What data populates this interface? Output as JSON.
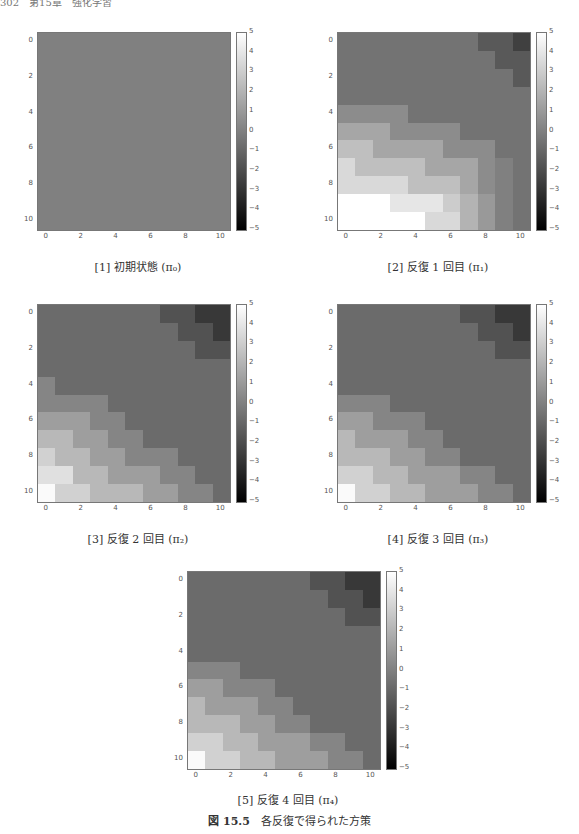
{
  "header": {
    "text": "302　第15章　強化学習"
  },
  "figure": {
    "label": "図 15.5",
    "caption": "各反復で得られた方策"
  },
  "panels": [
    {
      "caption": "[1] 初期状態 (π₀)"
    },
    {
      "caption": "[2] 反復 1 回目 (π₁)"
    },
    {
      "caption": "[3] 反復 2 回目 (π₂)"
    },
    {
      "caption": "[4] 反復 3 回目 (π₃)"
    },
    {
      "caption": "[5] 反復 4 回目 (π₄)"
    }
  ],
  "axis": {
    "yticks": [
      "0",
      "2",
      "4",
      "6",
      "8",
      "10"
    ],
    "xticks": [
      "0",
      "2",
      "4",
      "6",
      "8",
      "10"
    ],
    "cbticks": [
      "5",
      "4",
      "3",
      "2",
      "1",
      "0",
      "−1",
      "−2",
      "−3",
      "−4",
      "−5"
    ]
  },
  "chart_data": [
    {
      "type": "heatmap",
      "title": "[1] 初期状態 (π0)",
      "x": [
        0,
        1,
        2,
        3,
        4,
        5,
        6,
        7,
        8,
        9,
        10
      ],
      "y": [
        0,
        1,
        2,
        3,
        4,
        5,
        6,
        7,
        8,
        9,
        10
      ],
      "colormap": "gray",
      "vmin": -5,
      "vmax": 5,
      "xticks": [
        0,
        2,
        4,
        6,
        8,
        10
      ],
      "yticks": [
        0,
        2,
        4,
        6,
        8,
        10
      ],
      "colorbar_ticks": [
        -5,
        -4,
        -3,
        -2,
        -1,
        0,
        1,
        2,
        3,
        4,
        5
      ],
      "values": [
        [
          0,
          0,
          0,
          0,
          0,
          0,
          0,
          0,
          0,
          0,
          0
        ],
        [
          0,
          0,
          0,
          0,
          0,
          0,
          0,
          0,
          0,
          0,
          0
        ],
        [
          0,
          0,
          0,
          0,
          0,
          0,
          0,
          0,
          0,
          0,
          0
        ],
        [
          0,
          0,
          0,
          0,
          0,
          0,
          0,
          0,
          0,
          0,
          0
        ],
        [
          0,
          0,
          0,
          0,
          0,
          0,
          0,
          0,
          0,
          0,
          0
        ],
        [
          0,
          0,
          0,
          0,
          0,
          0,
          0,
          0,
          0,
          0,
          0
        ],
        [
          0,
          0,
          0,
          0,
          0,
          0,
          0,
          0,
          0,
          0,
          0
        ],
        [
          0,
          0,
          0,
          0,
          0,
          0,
          0,
          0,
          0,
          0,
          0
        ],
        [
          0,
          0,
          0,
          0,
          0,
          0,
          0,
          0,
          0,
          0,
          0
        ],
        [
          0,
          0,
          0,
          0,
          0,
          0,
          0,
          0,
          0,
          0,
          0
        ],
        [
          0,
          0,
          0,
          0,
          0,
          0,
          0,
          0,
          0,
          0,
          0
        ]
      ]
    },
    {
      "type": "heatmap",
      "title": "[2] 反復 1 回目 (π1)",
      "x": [
        0,
        1,
        2,
        3,
        4,
        5,
        6,
        7,
        8,
        9,
        10
      ],
      "y": [
        0,
        1,
        2,
        3,
        4,
        5,
        6,
        7,
        8,
        9,
        10
      ],
      "colormap": "gray",
      "vmin": -5,
      "vmax": 5,
      "xticks": [
        0,
        2,
        4,
        6,
        8,
        10
      ],
      "yticks": [
        0,
        2,
        4,
        6,
        8,
        10
      ],
      "colorbar_ticks": [
        -5,
        -4,
        -3,
        -2,
        -1,
        0,
        1,
        2,
        3,
        4,
        5
      ],
      "values": [
        [
          -0.5,
          -0.5,
          -0.5,
          -0.5,
          -0.5,
          -0.5,
          -0.5,
          -0.5,
          -1.5,
          -1.5,
          -2.5
        ],
        [
          -0.5,
          -0.5,
          -0.5,
          -0.5,
          -0.5,
          -0.5,
          -0.5,
          -0.5,
          -0.5,
          -1.5,
          -1.5
        ],
        [
          -0.5,
          -0.5,
          -0.5,
          -0.5,
          -0.5,
          -0.5,
          -0.5,
          -0.5,
          -0.5,
          -0.5,
          -1.5
        ],
        [
          -0.5,
          -0.5,
          -0.5,
          -0.5,
          -0.5,
          -0.5,
          -0.5,
          -0.5,
          -0.5,
          -0.5,
          -0.5
        ],
        [
          0.5,
          0.5,
          0.5,
          0.5,
          -0.5,
          -0.5,
          -0.5,
          -0.5,
          -0.5,
          -0.5,
          -0.5
        ],
        [
          1.5,
          1.5,
          1.5,
          0.5,
          0.5,
          0.5,
          0.5,
          -0.5,
          -0.5,
          -0.5,
          -0.5
        ],
        [
          2.5,
          2.5,
          1.5,
          1.5,
          1.5,
          1.5,
          0.5,
          0.5,
          0.5,
          -0.5,
          -0.5
        ],
        [
          3.5,
          2.5,
          2.5,
          2.5,
          2.5,
          1.5,
          1.5,
          1.5,
          0.5,
          0,
          -0.5
        ],
        [
          3.5,
          3.5,
          3.5,
          3.5,
          2.5,
          2.5,
          2.5,
          1.5,
          0.5,
          0,
          -0.5
        ],
        [
          5,
          5,
          5,
          4,
          4,
          4,
          3,
          2,
          1,
          0,
          -0.5
        ],
        [
          5,
          5,
          5,
          5,
          5,
          3.5,
          3.5,
          2,
          1,
          0,
          -0.5
        ]
      ]
    },
    {
      "type": "heatmap",
      "title": "[3] 反復 2 回目 (π2)",
      "x": [
        0,
        1,
        2,
        3,
        4,
        5,
        6,
        7,
        8,
        9,
        10
      ],
      "y": [
        0,
        1,
        2,
        3,
        4,
        5,
        6,
        7,
        8,
        9,
        10
      ],
      "colormap": "gray",
      "vmin": -5,
      "vmax": 5,
      "xticks": [
        0,
        2,
        4,
        6,
        8,
        10
      ],
      "yticks": [
        0,
        2,
        4,
        6,
        8,
        10
      ],
      "colorbar_ticks": [
        -5,
        -4,
        -3,
        -2,
        -1,
        0,
        1,
        2,
        3,
        4,
        5
      ],
      "values": [
        [
          -0.8,
          -0.8,
          -0.8,
          -0.8,
          -0.8,
          -0.8,
          -0.8,
          -1.8,
          -1.8,
          -2.8,
          -2.8
        ],
        [
          -0.8,
          -0.8,
          -0.8,
          -0.8,
          -0.8,
          -0.8,
          -0.8,
          -0.8,
          -1.8,
          -1.8,
          -2.8
        ],
        [
          -0.8,
          -0.8,
          -0.8,
          -0.8,
          -0.8,
          -0.8,
          -0.8,
          -0.8,
          -0.8,
          -1.8,
          -1.8
        ],
        [
          -0.8,
          -0.8,
          -0.8,
          -0.8,
          -0.8,
          -0.8,
          -0.8,
          -0.8,
          -0.8,
          -0.8,
          -0.8
        ],
        [
          0.2,
          -0.8,
          -0.8,
          -0.8,
          -0.8,
          -0.8,
          -0.8,
          -0.8,
          -0.8,
          -0.8,
          -0.8
        ],
        [
          0.2,
          0.2,
          0.2,
          0.2,
          -0.8,
          -0.8,
          -0.8,
          -0.8,
          -0.8,
          -0.8,
          -0.8
        ],
        [
          1.2,
          1.2,
          1.2,
          0.2,
          0.2,
          -0.8,
          -0.8,
          -0.8,
          -0.8,
          -0.8,
          -0.8
        ],
        [
          2.2,
          2.2,
          1.2,
          1.2,
          0.2,
          0.2,
          -0.8,
          -0.8,
          -0.8,
          -0.8,
          -0.8
        ],
        [
          3.2,
          2.2,
          2.2,
          1.2,
          1.2,
          0.2,
          0.2,
          0.2,
          -0.8,
          -0.8,
          -0.8
        ],
        [
          3.8,
          3.8,
          2.2,
          2.2,
          1.2,
          1.2,
          1.2,
          0.2,
          0.2,
          -0.8,
          -0.8
        ],
        [
          4.8,
          3.2,
          3.2,
          2.2,
          2.2,
          2.2,
          1.2,
          1.2,
          0.2,
          0.2,
          -0.8
        ]
      ]
    },
    {
      "type": "heatmap",
      "title": "[4] 反復 3 回目 (π3)",
      "x": [
        0,
        1,
        2,
        3,
        4,
        5,
        6,
        7,
        8,
        9,
        10
      ],
      "y": [
        0,
        1,
        2,
        3,
        4,
        5,
        6,
        7,
        8,
        9,
        10
      ],
      "colormap": "gray",
      "vmin": -5,
      "vmax": 5,
      "xticks": [
        0,
        2,
        4,
        6,
        8,
        10
      ],
      "yticks": [
        0,
        2,
        4,
        6,
        8,
        10
      ],
      "colorbar_ticks": [
        -5,
        -4,
        -3,
        -2,
        -1,
        0,
        1,
        2,
        3,
        4,
        5
      ],
      "values": [
        [
          -0.8,
          -0.8,
          -0.8,
          -0.8,
          -0.8,
          -0.8,
          -0.8,
          -1.8,
          -1.8,
          -2.8,
          -2.8
        ],
        [
          -0.8,
          -0.8,
          -0.8,
          -0.8,
          -0.8,
          -0.8,
          -0.8,
          -0.8,
          -1.8,
          -1.8,
          -2.8
        ],
        [
          -0.8,
          -0.8,
          -0.8,
          -0.8,
          -0.8,
          -0.8,
          -0.8,
          -0.8,
          -0.8,
          -1.8,
          -1.8
        ],
        [
          -0.8,
          -0.8,
          -0.8,
          -0.8,
          -0.8,
          -0.8,
          -0.8,
          -0.8,
          -0.8,
          -0.8,
          -0.8
        ],
        [
          -0.8,
          -0.8,
          -0.8,
          -0.8,
          -0.8,
          -0.8,
          -0.8,
          -0.8,
          -0.8,
          -0.8,
          -0.8
        ],
        [
          0.2,
          0.2,
          0.2,
          -0.8,
          -0.8,
          -0.8,
          -0.8,
          -0.8,
          -0.8,
          -0.8,
          -0.8
        ],
        [
          1.2,
          1.2,
          0.2,
          0.2,
          0.2,
          -0.8,
          -0.8,
          -0.8,
          -0.8,
          -0.8,
          -0.8
        ],
        [
          2.2,
          1.2,
          1.2,
          1.2,
          0.2,
          0.2,
          -0.8,
          -0.8,
          -0.8,
          -0.8,
          -0.8
        ],
        [
          2.2,
          2.2,
          2.2,
          1.2,
          1.2,
          0.2,
          0.2,
          -0.8,
          -0.8,
          -0.8,
          -0.8
        ],
        [
          3.2,
          3.2,
          2.2,
          2.2,
          1.2,
          1.2,
          1.2,
          0.2,
          0.2,
          -0.8,
          -0.8
        ],
        [
          4.8,
          3.2,
          3.2,
          2.2,
          2.2,
          1.2,
          1.2,
          1.2,
          0.2,
          0.2,
          -0.8
        ]
      ]
    },
    {
      "type": "heatmap",
      "title": "[5] 反復 4 回目 (π4)",
      "x": [
        0,
        1,
        2,
        3,
        4,
        5,
        6,
        7,
        8,
        9,
        10
      ],
      "y": [
        0,
        1,
        2,
        3,
        4,
        5,
        6,
        7,
        8,
        9,
        10
      ],
      "colormap": "gray",
      "vmin": -5,
      "vmax": 5,
      "xticks": [
        0,
        2,
        4,
        6,
        8,
        10
      ],
      "yticks": [
        0,
        2,
        4,
        6,
        8,
        10
      ],
      "colorbar_ticks": [
        -5,
        -4,
        -3,
        -2,
        -1,
        0,
        1,
        2,
        3,
        4,
        5
      ],
      "values": [
        [
          -0.8,
          -0.8,
          -0.8,
          -0.8,
          -0.8,
          -0.8,
          -0.8,
          -1.8,
          -1.8,
          -2.8,
          -2.8
        ],
        [
          -0.8,
          -0.8,
          -0.8,
          -0.8,
          -0.8,
          -0.8,
          -0.8,
          -0.8,
          -1.8,
          -1.8,
          -2.8
        ],
        [
          -0.8,
          -0.8,
          -0.8,
          -0.8,
          -0.8,
          -0.8,
          -0.8,
          -0.8,
          -0.8,
          -1.8,
          -1.8
        ],
        [
          -0.8,
          -0.8,
          -0.8,
          -0.8,
          -0.8,
          -0.8,
          -0.8,
          -0.8,
          -0.8,
          -0.8,
          -0.8
        ],
        [
          -0.8,
          -0.8,
          -0.8,
          -0.8,
          -0.8,
          -0.8,
          -0.8,
          -0.8,
          -0.8,
          -0.8,
          -0.8
        ],
        [
          0.2,
          0.2,
          0.2,
          -0.8,
          -0.8,
          -0.8,
          -0.8,
          -0.8,
          -0.8,
          -0.8,
          -0.8
        ],
        [
          1.2,
          1.2,
          0.2,
          0.2,
          0.2,
          -0.8,
          -0.8,
          -0.8,
          -0.8,
          -0.8,
          -0.8
        ],
        [
          2.2,
          1.2,
          1.2,
          1.2,
          0.2,
          0.2,
          -0.8,
          -0.8,
          -0.8,
          -0.8,
          -0.8
        ],
        [
          2.2,
          2.2,
          2.2,
          1.2,
          1.2,
          0.2,
          0.2,
          -0.8,
          -0.8,
          -0.8,
          -0.8
        ],
        [
          3.2,
          3.2,
          2.2,
          2.2,
          1.2,
          1.2,
          1.2,
          0.2,
          0.2,
          -0.8,
          -0.8
        ],
        [
          4.8,
          3.2,
          3.2,
          2.2,
          2.2,
          1.2,
          1.2,
          1.2,
          0.2,
          0.2,
          -0.8
        ]
      ]
    }
  ]
}
